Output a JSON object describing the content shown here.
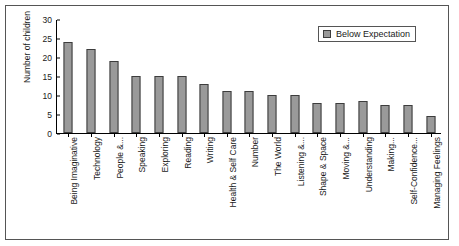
{
  "chart_data": {
    "type": "bar",
    "title": "",
    "xlabel": "",
    "ylabel": "Number of children",
    "ylim": [
      0,
      30
    ],
    "yticks": [
      0,
      5,
      10,
      15,
      20,
      25,
      30
    ],
    "grid": false,
    "legend_position": "top-right",
    "legend": [
      "Below Expectation"
    ],
    "categories": [
      "Being Imaginative",
      "Technology",
      "People &...",
      "Speaking",
      "Exploring",
      "Reading",
      "Writing",
      "Health & Self Care",
      "Number",
      "The World",
      "Listening &...",
      "Shape & Space",
      "Moving &...",
      "Understanding",
      "Making...",
      "Self-Confidence...",
      "Managing Feelings"
    ],
    "series": [
      {
        "name": "Below Expectation",
        "values": [
          24,
          22,
          19,
          15,
          15,
          15,
          13,
          11,
          11,
          10,
          10,
          8,
          8,
          8.5,
          7.5,
          7.5,
          4.5
        ]
      }
    ],
    "colors": {
      "bar_fill": "#9a9a9a",
      "bar_stroke": "#3d3d3d",
      "axis": "#000000",
      "text": "#1a1a1a",
      "frame": "#555555",
      "background": "#ffffff"
    }
  }
}
